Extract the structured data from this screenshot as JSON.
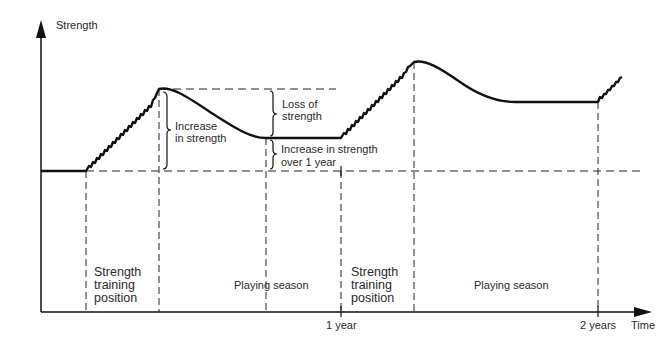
{
  "diagram": {
    "y_axis_label": "Strength",
    "x_axis_label": "Time",
    "x_ticks": [
      {
        "label": "1 year"
      },
      {
        "label": "2 years"
      }
    ],
    "annotations": {
      "increase": "Increase\nin strength",
      "increase_l1": "Increase",
      "increase_l2": "in strength",
      "loss_l1": "Loss of",
      "loss_l2": "strength",
      "yearly_l1": "Increase in strength",
      "yearly_l2": "over 1 year"
    },
    "phases": [
      {
        "l1": "Strength",
        "l2": "training",
        "l3": "position"
      },
      {
        "label": "Playing season"
      },
      {
        "l1": "Strength",
        "l2": "training",
        "l3": "position"
      },
      {
        "label": "Playing season"
      }
    ],
    "colors": {
      "line": "#111111",
      "dash": "#222222"
    }
  }
}
